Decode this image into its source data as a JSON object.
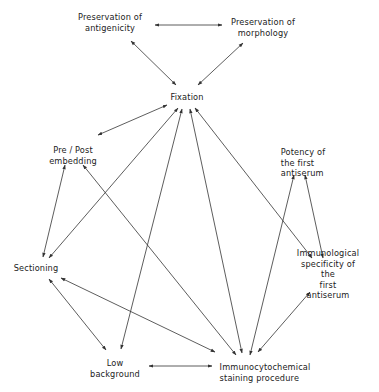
{
  "diagram": {
    "type": "relationship-network",
    "nodes": [
      {
        "id": "antigenicity",
        "label": "Preservation of\nantigenicity",
        "x": 110,
        "y": 22
      },
      {
        "id": "morphology",
        "label": "Preservation of\nmorphology",
        "x": 263,
        "y": 27
      },
      {
        "id": "fixation",
        "label": "Fixation",
        "x": 187,
        "y": 97
      },
      {
        "id": "prepost",
        "label": "Pre / Post\nembedding",
        "x": 73,
        "y": 155
      },
      {
        "id": "potency",
        "label": "Potency of\nthe first\n antiserum",
        "x": 303,
        "y": 163
      },
      {
        "id": "sectioning",
        "label": "Sectioning",
        "x": 36,
        "y": 268
      },
      {
        "id": "specificity",
        "label": "Immunological\nspecificity of the\nfirst antiserum",
        "x": 328,
        "y": 274
      },
      {
        "id": "lowbg",
        "label": "Low\nbackground",
        "x": 115,
        "y": 368
      },
      {
        "id": "staining",
        "label": "Immunocytochemical\nstaining procedure",
        "x": 265,
        "y": 372
      }
    ],
    "edges": [
      {
        "from": "antigenicity",
        "to": "morphology",
        "x1": 155,
        "y1": 25,
        "x2": 222,
        "y2": 25
      },
      {
        "from": "antigenicity",
        "to": "fixation",
        "x1": 131,
        "y1": 41,
        "x2": 176,
        "y2": 85
      },
      {
        "from": "morphology",
        "to": "fixation",
        "x1": 243,
        "y1": 43,
        "x2": 198,
        "y2": 85
      },
      {
        "from": "fixation",
        "to": "prepost",
        "x1": 167,
        "y1": 105,
        "x2": 98,
        "y2": 135
      },
      {
        "from": "fixation",
        "to": "sectioning",
        "x1": 178,
        "y1": 108,
        "x2": 49,
        "y2": 258
      },
      {
        "from": "fixation",
        "to": "lowbg",
        "x1": 182,
        "y1": 109,
        "x2": 121,
        "y2": 349
      },
      {
        "from": "fixation",
        "to": "staining",
        "x1": 190,
        "y1": 109,
        "x2": 242,
        "y2": 353
      },
      {
        "from": "fixation",
        "to": "specificity",
        "x1": 195,
        "y1": 108,
        "x2": 312,
        "y2": 258
      },
      {
        "from": "prepost",
        "to": "sectioning",
        "x1": 65,
        "y1": 165,
        "x2": 43,
        "y2": 257
      },
      {
        "from": "prepost",
        "to": "staining",
        "x1": 83,
        "y1": 165,
        "x2": 236,
        "y2": 355
      },
      {
        "from": "potency",
        "to": "staining",
        "x1": 294,
        "y1": 175,
        "x2": 250,
        "y2": 355
      },
      {
        "from": "potency",
        "to": "specificity",
        "x1": 305,
        "y1": 175,
        "x2": 323,
        "y2": 258
      },
      {
        "from": "sectioning",
        "to": "lowbg",
        "x1": 49,
        "y1": 279,
        "x2": 106,
        "y2": 350
      },
      {
        "from": "sectioning",
        "to": "staining",
        "x1": 61,
        "y1": 278,
        "x2": 215,
        "y2": 352
      },
      {
        "from": "specificity",
        "to": "staining",
        "x1": 310,
        "y1": 292,
        "x2": 258,
        "y2": 352
      },
      {
        "from": "lowbg",
        "to": "staining",
        "x1": 149,
        "y1": 366,
        "x2": 212,
        "y2": 366
      }
    ],
    "style": {
      "line_color": "#333333",
      "text_color": "#222222",
      "background": "#ffffff"
    }
  }
}
